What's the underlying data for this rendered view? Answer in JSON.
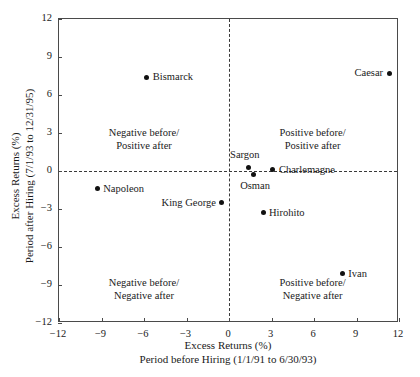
{
  "chart_data": {
    "type": "scatter",
    "title": "",
    "xlabel": "Excess Returns (%)",
    "xlabel_sub": "Period before Hiring (1/1/91 to 6/30/93)",
    "ylabel": "Excess Returns (%)",
    "ylabel_sub": "Period after Hiring (7/1/93 to 12/31/95)",
    "xlim": [
      -12,
      12
    ],
    "ylim": [
      -12,
      12
    ],
    "xticks": [
      -12,
      -9,
      -6,
      -3,
      0,
      3,
      6,
      9,
      12
    ],
    "yticks": [
      -12,
      -9,
      -6,
      -3,
      0,
      3,
      6,
      9,
      12
    ],
    "xtick_labels": [
      "−12",
      "−9",
      "−6",
      "−3",
      "0",
      "3",
      "6",
      "9",
      "12"
    ],
    "ytick_labels": [
      "−12",
      "−9",
      "−6",
      "−3",
      "0",
      "3",
      "6",
      "9",
      "12"
    ],
    "grid": false,
    "legend": "none",
    "reference_lines": [
      {
        "axis": "x",
        "value": 0,
        "style": "dashed"
      },
      {
        "axis": "y",
        "value": 0,
        "style": "dashed"
      }
    ],
    "points": [
      {
        "name": "Bismarck",
        "x": -5.8,
        "y": 7.4,
        "label_pos": "right"
      },
      {
        "name": "Caesar",
        "x": 11.3,
        "y": 7.7,
        "label_pos": "left"
      },
      {
        "name": "Napoleon",
        "x": -9.3,
        "y": -1.4,
        "label_pos": "right"
      },
      {
        "name": "King George",
        "x": -0.5,
        "y": -2.5,
        "label_pos": "left"
      },
      {
        "name": "Sargon",
        "x": 1.4,
        "y": 0.3,
        "label_pos": "above"
      },
      {
        "name": "Osman",
        "x": 1.7,
        "y": -0.3,
        "label_pos": "below"
      },
      {
        "name": "Charlemagne",
        "x": 3.1,
        "y": 0.1,
        "label_pos": "right"
      },
      {
        "name": "Hirohito",
        "x": 2.4,
        "y": -3.3,
        "label_pos": "right"
      },
      {
        "name": "Ivan",
        "x": 8.0,
        "y": -8.1,
        "label_pos": "right"
      }
    ],
    "quadrant_notes": [
      {
        "id": "top-left",
        "line1": "Negative before/",
        "line2": "Positive after",
        "x": -6.0,
        "y": 2.5
      },
      {
        "id": "top-right",
        "line1": "Positive before/",
        "line2": "Positive after",
        "x": 5.9,
        "y": 2.5
      },
      {
        "id": "bottom-left",
        "line1": "Negative before/",
        "line2": "Negative after",
        "x": -6.0,
        "y": -9.3
      },
      {
        "id": "bottom-right",
        "line1": "Positive before/",
        "line2": "Negative after",
        "x": 5.9,
        "y": -9.3
      }
    ],
    "colors": {
      "marker": "#111111",
      "axis": "#4a4a4a",
      "reference_line": "#3a3a3a",
      "text": "#1a1a1a",
      "background": "#ffffff"
    }
  }
}
